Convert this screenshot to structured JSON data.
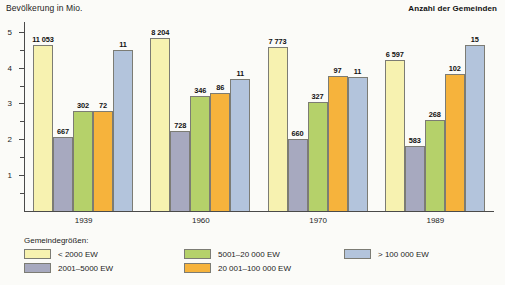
{
  "chart_data": {
    "type": "bar",
    "title": "",
    "ylabel": "Bevölkerung in Mio.",
    "right_label": "Anzahl der Gemeinden",
    "xlabel": "",
    "categories": [
      "1939",
      "1960",
      "1970",
      "1989"
    ],
    "ylim": [
      0,
      5.3
    ],
    "yticks": [
      1,
      2,
      3,
      4,
      5
    ],
    "ytick_labels": [
      "1",
      "2",
      "3",
      "4",
      "5"
    ],
    "minor_ticks": [
      0.5,
      1.5,
      2.5,
      3.5,
      4.5
    ],
    "grid": false,
    "legend_position": "bottom",
    "legend_title": "Gemeindegrößen:",
    "series": [
      {
        "name": "< 2000 EW",
        "color": "#f7f2b0",
        "values": [
          4.63,
          4.82,
          4.58,
          4.21
        ],
        "labels": [
          "11 053",
          "8 204",
          "7 773",
          "6 597"
        ]
      },
      {
        "name": "2001–5000 EW",
        "color": "#a7a9bf",
        "values": [
          2.07,
          2.23,
          2.02,
          1.8
        ],
        "labels": [
          "667",
          "728",
          "660",
          "583"
        ]
      },
      {
        "name": "5001–20 000 EW",
        "color": "#b5d16a",
        "values": [
          2.79,
          3.21,
          3.03,
          2.55
        ],
        "labels": [
          "302",
          "346",
          "327",
          "268"
        ]
      },
      {
        "name": "20 001–100 000 EW",
        "color": "#f6b33c",
        "values": [
          2.79,
          3.28,
          3.78,
          3.82
        ],
        "labels": [
          "72",
          "86",
          "97",
          "102"
        ]
      },
      {
        "name": "> 100 000 EW",
        "color": "#b3c4dc",
        "values": [
          4.48,
          3.68,
          3.73,
          4.63
        ],
        "labels": [
          "11",
          "11",
          "11",
          "15"
        ]
      }
    ]
  },
  "legend": {
    "title": "Gemeindegrößen:",
    "columns": [
      [
        {
          "label": "< 2000 EW",
          "color": "#f7f2b0"
        },
        {
          "label": "2001–5000 EW",
          "color": "#a7a9bf"
        }
      ],
      [
        {
          "label": "5001–20 000 EW",
          "color": "#b5d16a"
        },
        {
          "label": "20 001–100 000 EW",
          "color": "#f6b33c"
        }
      ],
      [
        {
          "label": "> 100 000 EW",
          "color": "#b3c4dc"
        }
      ]
    ]
  }
}
